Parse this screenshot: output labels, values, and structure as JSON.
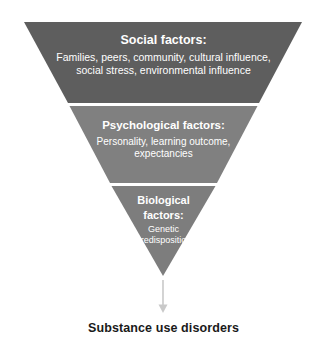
{
  "diagram": {
    "type": "inverted-pyramid-funnel",
    "colors": {
      "band_social": "#5e5e5e",
      "band_psychological": "#808080",
      "band_biological": "#7d7d7d",
      "divider": "#ffffff",
      "band_text": "#ffffff",
      "arrow": "#c9c9c9",
      "outcome_text": "#1a1a1a",
      "background": "#ffffff"
    },
    "levels": [
      {
        "id": "social",
        "title": "Social factors:",
        "body": "Families, peers, community, cultural influence, social stress, environmental influence",
        "body_lines": [
          "Families, peers, community, cultural influence,",
          "social stress, environmental influence"
        ],
        "color": "#5e5e5e"
      },
      {
        "id": "psychological",
        "title": "Psychological factors:",
        "body": "Personality, learning outcome, expectancies",
        "body_lines": [
          "Personality, learning outcome,",
          "expectancies"
        ],
        "color": "#808080"
      },
      {
        "id": "biological",
        "title": "Biological factors:",
        "title_lines": [
          "Biological",
          "factors:"
        ],
        "body": "Genetic predisposition",
        "body_lines": [
          "Genetic",
          "predisposition"
        ],
        "color": "#7d7d7d"
      }
    ],
    "arrow": {
      "direction": "down",
      "icon": "down-arrow-icon",
      "color": "#c9c9c9"
    },
    "outcome": {
      "label": "Substance use disorders"
    }
  }
}
